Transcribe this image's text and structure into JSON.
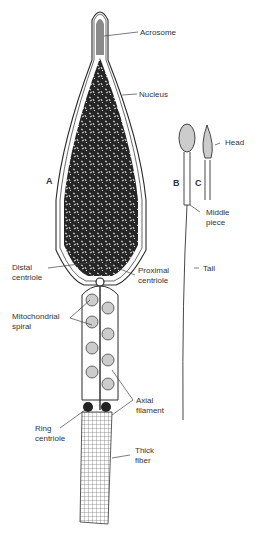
{
  "figure": {
    "panels": [
      "A",
      "B",
      "C"
    ],
    "labels": {
      "acrosome": "Acrosome",
      "nucleus": "Nucleus",
      "head": "Head",
      "middle_piece": "Middle\npiece",
      "distal_centriole": "Distal\ncentriole",
      "proximal_centriole": "Proximal\ncentriole",
      "tail": "Tail",
      "mitochondrial_spiral": "Mitochondrial\nspiral",
      "axial_filament": "Axial\nfilament",
      "ring_centriole": "Ring\ncentriole",
      "thick_fiber": "Thick\nfiber"
    },
    "colors": {
      "ink": "#2a2a2a",
      "nucleus": "#262626",
      "acrosome": "#8a8a8a"
    }
  }
}
